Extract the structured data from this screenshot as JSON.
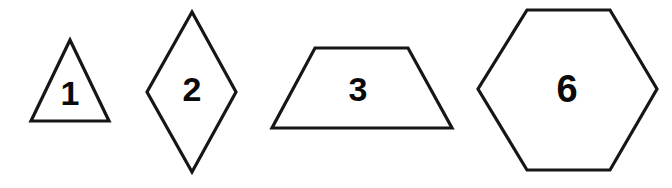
{
  "canvas": {
    "width": 672,
    "height": 188,
    "background_color": "#ffffff",
    "stroke_color": "#161616",
    "label_color": "#0a0a0a",
    "stroke_width": 3.2
  },
  "shapes": [
    {
      "name": "triangle",
      "label": "1",
      "sides": 3,
      "points": "70,40 109,121 31,121",
      "label_x": 70,
      "label_y": 96
    },
    {
      "name": "diamond",
      "label": "2",
      "sides": 4,
      "points": "192,12 236,92 192,172 147,92",
      "label_x": 192,
      "label_y": 92
    },
    {
      "name": "trapezoid",
      "label": "3",
      "sides": 4,
      "points": "315,48 408,48 452,128 272,128",
      "label_x": 358,
      "label_y": 92
    },
    {
      "name": "hexagon",
      "label": "6",
      "sides": 6,
      "points": "527,10 610,10 657,89 610,170 527,170 478,89",
      "label_x": 567,
      "label_y": 92
    }
  ]
}
